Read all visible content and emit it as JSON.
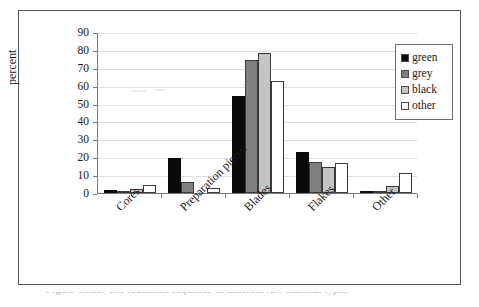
{
  "figure": {
    "caption": "Figure 10.13. The reduction sequence in different raw material types"
  },
  "chart_data": {
    "type": "bar",
    "title": "",
    "xlabel": "",
    "ylabel": "percent",
    "ylim": [
      0,
      90
    ],
    "ytick_step": 10,
    "yticks": [
      "90",
      "80",
      "70",
      "60",
      "50",
      "40",
      "30",
      "20",
      "10",
      "0"
    ],
    "grid": true,
    "legend_position": "right",
    "categories": [
      "Cores",
      "Preparation pieces",
      "Blades",
      "Flakes",
      "Other"
    ],
    "series": [
      {
        "name": "green",
        "color": "#0a0a0a",
        "values": [
          1.5,
          19.5,
          54.5,
          22.7,
          0.5
        ]
      },
      {
        "name": "grey",
        "color": "#808080",
        "values": [
          0.5,
          6.2,
          74.2,
          17.6,
          0.5
        ]
      },
      {
        "name": "black",
        "color": "#c4c4c4",
        "values": [
          2.0,
          0.0,
          78.5,
          14.4,
          3.7
        ]
      },
      {
        "name": "other",
        "color": "#ffffff",
        "values": [
          4.6,
          2.9,
          62.6,
          16.8,
          11.2
        ]
      }
    ]
  },
  "legend": {
    "items": [
      {
        "label": "green"
      },
      {
        "label": "grey"
      },
      {
        "label": "black"
      },
      {
        "label": "other"
      }
    ]
  }
}
